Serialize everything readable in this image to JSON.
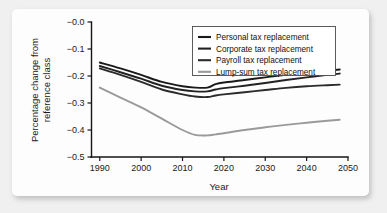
{
  "chart_data": {
    "type": "line",
    "title": "",
    "xlabel": "Year",
    "ylabel": "Percentage change from reference class",
    "ylabel_line1": "Percentage change from",
    "ylabel_line2": "reference class",
    "xlim": [
      1988,
      2050
    ],
    "ylim": [
      -0.5,
      0.0
    ],
    "grid": false,
    "legend_position": "top-right",
    "xticks": [
      1990,
      2000,
      2010,
      2020,
      2030,
      2040,
      2050
    ],
    "xtick_labels": [
      "1990",
      "2000",
      "2010",
      "2020",
      "2030",
      "2040",
      "2050"
    ],
    "yticks": [
      0.0,
      -0.1,
      -0.2,
      -0.3,
      -0.4,
      -0.5
    ],
    "ytick_labels": [
      "−0.0",
      "−0.1",
      "−0.2",
      "−0.3",
      "−0.4",
      "−0.5"
    ],
    "x": [
      1990,
      1995,
      2000,
      2005,
      2010,
      2013,
      2016,
      2018,
      2020,
      2025,
      2030,
      2035,
      2040,
      2045,
      2048
    ],
    "series": [
      {
        "name": "Personal tax replacement",
        "color": "#1a1a1a",
        "values": [
          -0.15,
          -0.172,
          -0.196,
          -0.222,
          -0.238,
          -0.243,
          -0.243,
          -0.23,
          -0.224,
          -0.215,
          -0.205,
          -0.196,
          -0.188,
          -0.18,
          -0.176
        ]
      },
      {
        "name": "Corporate tax replacement",
        "color": "#222222",
        "values": [
          -0.163,
          -0.186,
          -0.21,
          -0.236,
          -0.252,
          -0.257,
          -0.257,
          -0.25,
          -0.245,
          -0.236,
          -0.226,
          -0.215,
          -0.205,
          -0.196,
          -0.191
        ]
      },
      {
        "name": "Payroll tax replacement",
        "color": "#2b2b2b",
        "values": [
          -0.172,
          -0.196,
          -0.222,
          -0.25,
          -0.268,
          -0.276,
          -0.278,
          -0.272,
          -0.268,
          -0.26,
          -0.252,
          -0.244,
          -0.238,
          -0.234,
          -0.232
        ]
      },
      {
        "name": "Lump-sum tax replacement",
        "color": "#9a9a9a",
        "values": [
          -0.243,
          -0.28,
          -0.316,
          -0.358,
          -0.4,
          -0.418,
          -0.42,
          -0.416,
          -0.412,
          -0.4,
          -0.39,
          -0.381,
          -0.373,
          -0.366,
          -0.362
        ]
      }
    ]
  },
  "legend": {
    "entries": [
      "Personal tax replacement",
      "Corporate tax replacement",
      "Payroll tax replacement",
      "Lump-sum tax replacement"
    ]
  }
}
